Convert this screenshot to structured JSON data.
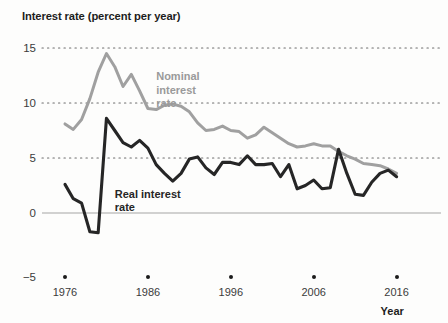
{
  "chart_data": {
    "type": "line",
    "title": "Interest rate (percent per year)",
    "xlabel": "Year",
    "ylabel": "Interest rate (percent per year)",
    "xlim": [
      1975,
      2017
    ],
    "ylim": [
      -5,
      15
    ],
    "yticks": [
      -5,
      0,
      5,
      10,
      15
    ],
    "ytick_labels": [
      "−5",
      "0",
      "5",
      "10",
      "15"
    ],
    "xticks": [
      1976,
      1986,
      1996,
      2006,
      2016
    ],
    "xtick_labels": [
      "1976",
      "1986",
      "1996",
      "2006",
      "2016"
    ],
    "grid": "horizontal dotted gridlines at 5, 10, 15; solid light line at 0",
    "legend_position": "inline annotations",
    "series": [
      {
        "name": "Nominal interest rate",
        "color": "#a0a0a0",
        "x": [
          1976,
          1977,
          1978,
          1979,
          1980,
          1981,
          1982,
          1983,
          1984,
          1985,
          1986,
          1987,
          1988,
          1989,
          1990,
          1991,
          1992,
          1993,
          1994,
          1995,
          1996,
          1997,
          1998,
          1999,
          2000,
          2001,
          2002,
          2003,
          2004,
          2005,
          2006,
          2007,
          2008,
          2009,
          2010,
          2011,
          2012,
          2013,
          2014,
          2015,
          2016
        ],
        "values": [
          8.1,
          7.6,
          8.5,
          10.4,
          12.8,
          14.5,
          13.3,
          11.5,
          12.6,
          11.1,
          9.5,
          9.4,
          9.8,
          9.9,
          9.7,
          9.2,
          8.2,
          7.5,
          7.6,
          7.9,
          7.5,
          7.4,
          6.8,
          7.1,
          7.8,
          7.3,
          6.8,
          6.3,
          6.0,
          6.1,
          6.3,
          6.1,
          6.1,
          5.6,
          5.2,
          4.9,
          4.5,
          4.4,
          4.3,
          4.0,
          3.6
        ]
      },
      {
        "name": "Real interest rate",
        "color": "#262626",
        "x": [
          1976,
          1977,
          1978,
          1979,
          1980,
          1981,
          1982,
          1983,
          1984,
          1985,
          1986,
          1987,
          1988,
          1989,
          1990,
          1991,
          1992,
          1993,
          1994,
          1995,
          1996,
          1997,
          1998,
          1999,
          2000,
          2001,
          2002,
          2003,
          2004,
          2005,
          2006,
          2007,
          2008,
          2009,
          2010,
          2011,
          2012,
          2013,
          2014,
          2015,
          2016
        ],
        "values": [
          2.6,
          1.3,
          0.9,
          -1.7,
          -1.8,
          8.6,
          7.5,
          6.4,
          6.0,
          6.6,
          5.9,
          4.4,
          3.6,
          2.9,
          3.6,
          4.9,
          5.1,
          4.1,
          3.5,
          4.6,
          4.6,
          4.4,
          5.2,
          4.4,
          4.4,
          4.5,
          3.3,
          4.4,
          2.2,
          2.5,
          3.0,
          2.2,
          2.3,
          5.8,
          3.6,
          1.7,
          1.6,
          2.8,
          3.6,
          3.9,
          3.3
        ]
      }
    ],
    "annotations": [
      {
        "name": "nominal-series-label",
        "text_lines": [
          "Nominal",
          "interest",
          "rate"
        ],
        "x": 1987,
        "y": 13.0
      },
      {
        "name": "real-series-label",
        "text_lines": [
          "Real interest",
          "rate"
        ],
        "x": 1982,
        "y": 2.3
      }
    ]
  }
}
